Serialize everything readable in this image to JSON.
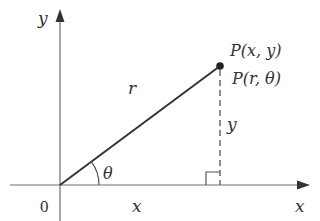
{
  "diagram": {
    "type": "polar-coordinates",
    "colors": {
      "axis": "#6e6e6e",
      "line": "#333333",
      "text": "#333333",
      "background": "#ffffff"
    },
    "axes": {
      "x_label": "x",
      "y_label": "y",
      "origin_label": "0"
    },
    "point": {
      "cartesian_label": "P(x, y)",
      "polar_label": "P(r, θ)"
    },
    "segments": {
      "radius_label": "r",
      "horizontal_label": "x",
      "vertical_label": "y",
      "angle_label": "θ"
    }
  }
}
